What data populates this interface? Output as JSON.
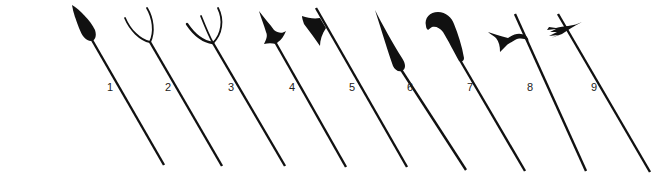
{
  "figure": {
    "background_color": "#ffffff",
    "ink_color": "#111111",
    "weapons": [
      {
        "number": "1",
        "type": "spear-icon",
        "label_pos": [
          110,
          87
        ]
      },
      {
        "number": "2",
        "type": "two-prong-fork-icon",
        "label_pos": [
          168,
          87
        ]
      },
      {
        "number": "3",
        "type": "three-prong-trident-icon",
        "label_pos": [
          231,
          87
        ]
      },
      {
        "number": "4",
        "type": "spiked-axe-head-icon",
        "label_pos": [
          292,
          87
        ]
      },
      {
        "number": "5",
        "type": "halberd-axe-blade-icon",
        "label_pos": [
          352,
          87
        ]
      },
      {
        "number": "6",
        "type": "glaive-blade-icon",
        "label_pos": [
          410,
          87
        ]
      },
      {
        "number": "7",
        "type": "hooked-bill-blade-icon",
        "label_pos": [
          470,
          87
        ]
      },
      {
        "number": "8",
        "type": "crescent-halberd-icon",
        "label_pos": [
          530,
          87
        ]
      },
      {
        "number": "9",
        "type": "winged-halberd-icon",
        "label_pos": [
          594,
          87
        ]
      }
    ]
  }
}
